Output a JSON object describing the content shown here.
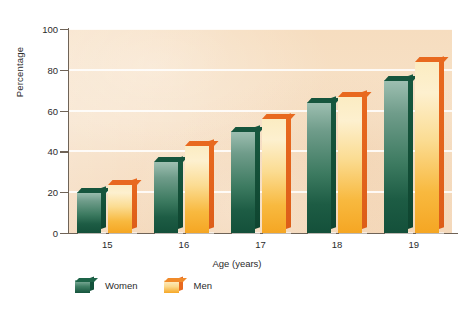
{
  "chart_data": {
    "type": "bar",
    "title": "",
    "subtitle": "",
    "xlabel": "Age (years)",
    "ylabel": "Percentage",
    "categories": [
      "15",
      "16",
      "17",
      "18",
      "19"
    ],
    "series": [
      {
        "name": "Women",
        "color": "#1d5c44",
        "values": [
          20,
          35,
          50,
          64,
          75
        ]
      },
      {
        "name": "Men",
        "color": "#f5a623",
        "values": [
          24,
          43,
          56,
          67,
          84
        ]
      }
    ],
    "ylim": [
      0,
      100
    ],
    "yticks": [
      0,
      20,
      40,
      60,
      80,
      100
    ],
    "ytick_labels": [
      "0",
      "20",
      "40",
      "60",
      "80",
      "100"
    ],
    "grid": true,
    "grid_axis": "y",
    "legend_position": "bottom-left",
    "plot_background_color": "#f6ddbf",
    "gridline_color": "#ffffff",
    "axis_color": "#6f6357",
    "figure_background_color": "#ffffff",
    "style": "3d-bars"
  },
  "legend": {
    "items": [
      {
        "label": "Women"
      },
      {
        "label": "Men"
      }
    ]
  }
}
